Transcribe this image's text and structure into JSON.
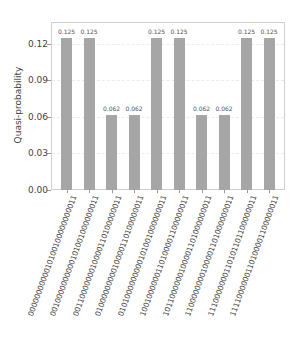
{
  "chart_data": {
    "type": "bar",
    "title": "",
    "xlabel": "",
    "ylabel": "Quasi-probability",
    "ylim": [
      0,
      0.138
    ],
    "yticks": [
      "0.00",
      "0.03",
      "0.06",
      "0.09",
      "0.12"
    ],
    "grid": true,
    "bar_color": "#a6a6a6",
    "categories": [
      "0000000000010100100000000011",
      "0010000000000101001000000011",
      "0011000000010000110100000011",
      "0100000000010000110100000011",
      "0101000000000101001000000011",
      "1001000000110100001100000011",
      "1011000000100001101000000011",
      "1100000000100001101000000011",
      "1110000000110101101100000011",
      "1111000000110100001100000011"
    ],
    "values": [
      0.125,
      0.125,
      0.062,
      0.062,
      0.125,
      0.125,
      0.062,
      0.062,
      0.125,
      0.125
    ],
    "value_labels": [
      "0.125",
      "0.125",
      "0.062",
      "0.062",
      "0.125",
      "0.125",
      "0.062",
      "0.062",
      "0.125",
      "0.125"
    ]
  }
}
